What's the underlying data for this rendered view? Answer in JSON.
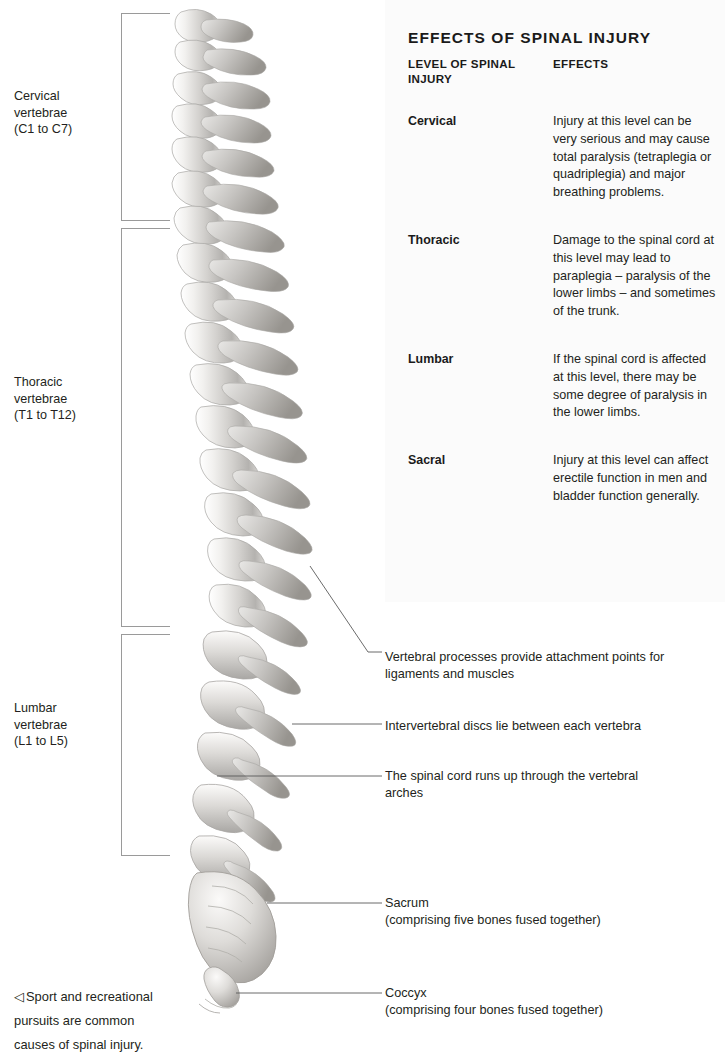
{
  "groups": [
    {
      "name": "cervical",
      "line1": "Cervical",
      "line2": "vertebrae",
      "line3": "(C1 to C7)"
    },
    {
      "name": "thoracic",
      "line1": "Thoracic",
      "line2": "vertebrae",
      "line3": "(T1 to T12)"
    },
    {
      "name": "lumbar",
      "line1": "Lumbar",
      "line2": "vertebrae",
      "line3": "(L1 to L5)"
    }
  ],
  "panel": {
    "title": "EFFECTS OF SPINAL INJURY",
    "header_level_line1": "Level of spinal",
    "header_level_line2": "injury",
    "header_effects": "Effects",
    "rows": [
      {
        "level": "Cervical",
        "effect": "Injury at this level can be very serious and may cause total paralysis (tetraplegia or quadriplegia) and major breathing problems."
      },
      {
        "level": "Thoracic",
        "effect": "Damage to the spinal cord at this level may lead to paraplegia – paralysis of the lower limbs – and sometimes of the trunk."
      },
      {
        "level": "Lumbar",
        "effect": "If the spinal cord is affected at this level, there may be some degree of paralysis in the lower limbs."
      },
      {
        "level": "Sacral",
        "effect": "Injury at this level can affect erectile function in men and bladder function generally."
      }
    ]
  },
  "callouts": [
    {
      "name": "vertebral-processes",
      "line1": "Vertebral processes provide attachment points for",
      "line2": "ligaments and muscles"
    },
    {
      "name": "intervertebral-discs",
      "line1": "Intervertebral discs lie between each vertebra",
      "line2": ""
    },
    {
      "name": "spinal-cord",
      "line1": "The spinal cord runs up through the vertebral",
      "line2": "arches"
    },
    {
      "name": "sacrum",
      "line1": "Sacrum",
      "line2": "(comprising five bones fused together)"
    },
    {
      "name": "coccyx",
      "line1": "Coccyx",
      "line2": "(comprising four bones fused together)"
    }
  ],
  "caption": {
    "marker": "◁",
    "line1": "Sport and recreational",
    "line2": "pursuits are common",
    "line3": "causes of spinal injury."
  },
  "colors": {
    "panel_background": "#fbfbfb",
    "text": "#231f20",
    "bracket": "#9a9a9a",
    "leader_line": "#5a5a5a",
    "bone_light": "#efeeec",
    "bone_mid": "#c9c7c4",
    "bone_dark": "#9d9b98"
  }
}
